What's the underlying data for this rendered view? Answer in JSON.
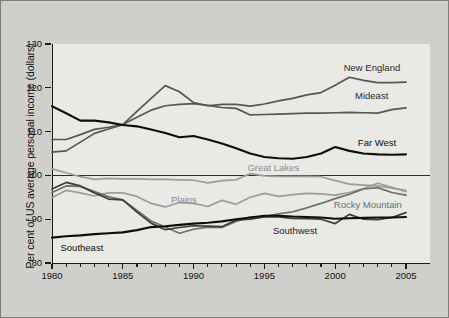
{
  "chart_data": {
    "type": "line",
    "title": "",
    "xlabel": "",
    "ylabel": "Per cent of US average personal income (dollars)",
    "xlim": [
      1980,
      2005
    ],
    "ylim": [
      80,
      130
    ],
    "yticks": [
      80,
      90,
      100,
      110,
      120,
      130
    ],
    "ytick_labels": [
      "80",
      "90",
      "100",
      "110",
      "120",
      "130"
    ],
    "xticks": [
      1980,
      1985,
      1990,
      1995,
      2000,
      2005
    ],
    "xtick_labels": [
      "1980",
      "1985",
      "1990",
      "1995",
      "2000",
      "2005"
    ],
    "xtick_minor_every": 1,
    "grid": false,
    "legend": "inline-labels",
    "reference_line": 100,
    "background_color": "#cfcfcb",
    "plot_background_color": "#e9e9e6",
    "x": [
      1980,
      1981,
      1982,
      1983,
      1984,
      1985,
      1986,
      1987,
      1988,
      1989,
      1990,
      1991,
      1992,
      1993,
      1994,
      1995,
      1996,
      1997,
      1998,
      1999,
      2000,
      2001,
      2002,
      2003,
      2004,
      2005
    ],
    "series": [
      {
        "name": "New England",
        "color": "#565656",
        "label_color": "#2b2b2b",
        "label_x": 2000.6,
        "label_y": 124.6,
        "values": [
          105.3,
          105.6,
          107.6,
          109.6,
          110.6,
          111.6,
          114.6,
          117.6,
          120.5,
          119.1,
          116.6,
          115.9,
          116.2,
          116.2,
          115.8,
          116.3,
          117.0,
          117.6,
          118.4,
          118.9,
          120.6,
          122.4,
          121.7,
          121.2,
          121.2,
          121.3
        ]
      },
      {
        "name": "Mideast",
        "color": "#565656",
        "label_color": "#2b2b2b",
        "label_x": 2001.4,
        "label_y": 118.2,
        "values": [
          108.2,
          108.2,
          109.3,
          110.5,
          111.0,
          111.6,
          113.3,
          114.9,
          115.9,
          116.2,
          116.4,
          116.0,
          115.5,
          115.3,
          113.8,
          113.9,
          114.0,
          114.1,
          114.2,
          114.2,
          114.3,
          114.4,
          114.3,
          114.2,
          115.0,
          115.4
        ]
      },
      {
        "name": "Far West",
        "color": "#0d0d0d",
        "label_color": "#0d0d0d",
        "label_x": 2001.6,
        "label_y": 107.3,
        "values": [
          115.8,
          114.2,
          112.5,
          112.5,
          112.1,
          111.5,
          111.2,
          110.5,
          109.7,
          108.7,
          109.0,
          108.2,
          107.3,
          106.2,
          105.0,
          104.2,
          103.9,
          103.8,
          104.2,
          105.0,
          106.5,
          105.6,
          105.0,
          104.8,
          104.7,
          104.8
        ]
      },
      {
        "name": "Great Lakes",
        "color": "#9c9c9c",
        "label_color": "#8c8c8c",
        "label_x": 1993.8,
        "label_y": 101.6,
        "values": [
          101.5,
          100.6,
          99.7,
          99.1,
          99.3,
          99.2,
          99.2,
          99.1,
          99.1,
          99.0,
          98.9,
          98.3,
          98.8,
          99.0,
          100.4,
          99.9,
          99.8,
          99.8,
          99.8,
          99.7,
          98.8,
          98.0,
          97.8,
          97.6,
          97.1,
          96.6
        ]
      },
      {
        "name": "Plains",
        "color": "#9c9c9c",
        "label_color": "#8c8c8c",
        "label_x": 1988.4,
        "label_y": 94.4,
        "values": [
          94.9,
          96.6,
          96.0,
          95.3,
          96.0,
          96.0,
          95.2,
          93.6,
          92.8,
          93.8,
          93.6,
          92.9,
          94.3,
          93.4,
          95.0,
          95.9,
          95.2,
          95.6,
          95.9,
          95.8,
          95.5,
          96.1,
          97.0,
          98.2,
          97.3,
          96.3
        ]
      },
      {
        "name": "Rocky Mountain",
        "color": "#6e6e6e",
        "label_color": "#6e6e6e",
        "label_x": 1999.9,
        "label_y": 93.3,
        "values": [
          96.1,
          97.6,
          97.5,
          96.3,
          95.1,
          94.4,
          92.0,
          89.6,
          88.2,
          86.8,
          87.7,
          88.2,
          88.1,
          89.5,
          90.5,
          90.6,
          91.2,
          91.7,
          92.6,
          93.6,
          94.7,
          95.7,
          96.9,
          97.2,
          96.1,
          95.5
        ]
      },
      {
        "name": "Southwest",
        "color": "#3c3c3c",
        "label_color": "#1c1c1c",
        "label_x": 1995.6,
        "label_y": 87.2,
        "values": [
          96.9,
          98.4,
          97.6,
          96.0,
          94.6,
          94.4,
          91.6,
          89.1,
          87.6,
          88.1,
          88.5,
          88.4,
          88.3,
          89.8,
          90.0,
          90.5,
          90.5,
          90.2,
          90.1,
          90.0,
          89.0,
          91.1,
          90.0,
          89.9,
          90.4,
          91.5
        ]
      },
      {
        "name": "Southeast",
        "color": "#0d0d0d",
        "label_color": "#0d0d0d",
        "label_x": 1980.6,
        "label_y": 83.4,
        "values": [
          85.8,
          86.1,
          86.3,
          86.6,
          86.8,
          87.0,
          87.5,
          88.2,
          88.4,
          88.7,
          89.0,
          89.2,
          89.5,
          90.0,
          90.4,
          90.8,
          90.8,
          90.6,
          90.5,
          90.4,
          90.1,
          90.2,
          90.3,
          90.4,
          90.4,
          90.5
        ]
      }
    ]
  }
}
